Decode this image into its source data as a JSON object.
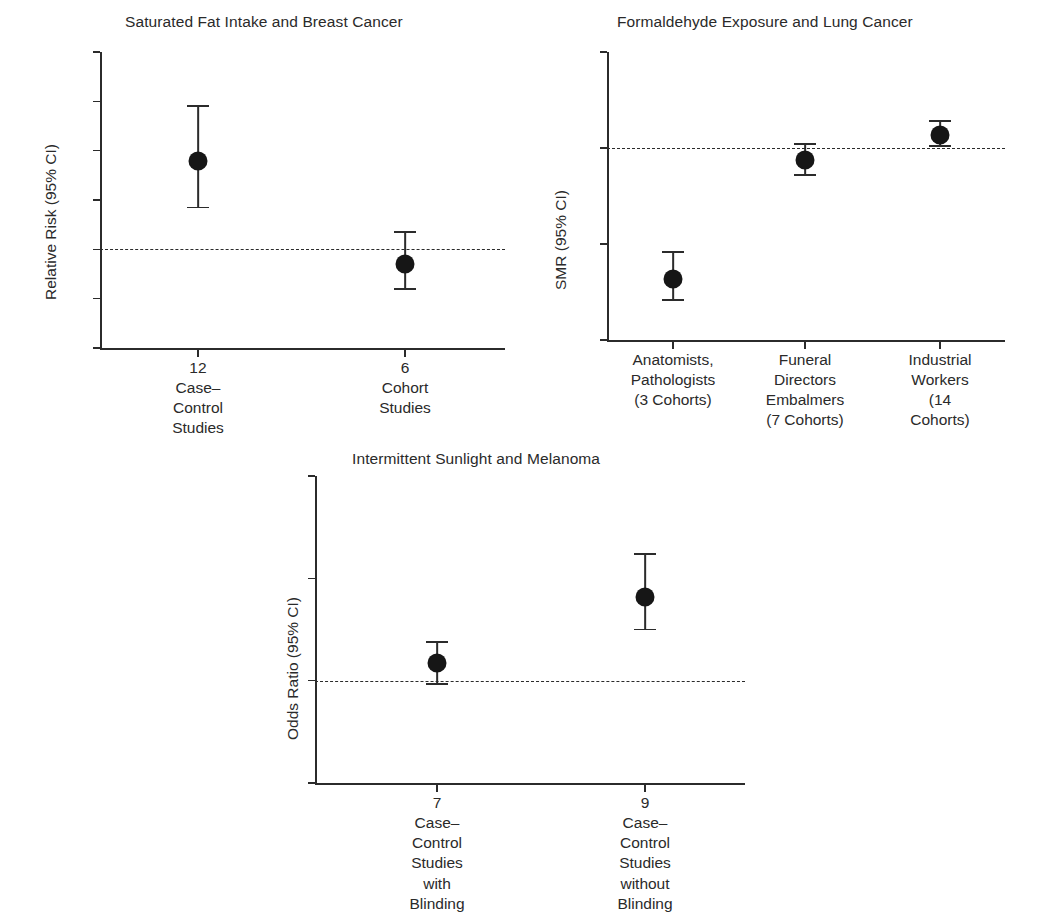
{
  "figure": {
    "panels": [
      "saturated_fat",
      "formaldehyde",
      "sunlight"
    ]
  },
  "chart_data": [
    {
      "type": "scatter",
      "id": "saturated_fat",
      "title": "Saturated Fat Intake and Breast Cancer",
      "ylabel": "Relative Risk (95% CI)",
      "xlabel": "",
      "ylim": [
        0.6,
        1.8
      ],
      "yticks": [
        0.6,
        0.8,
        1.0,
        1.2,
        1.4,
        1.6,
        1.8
      ],
      "ytick_labels": [
        "0.6",
        "0.8",
        "1.0",
        "1.2",
        "1.4",
        "1.6",
        "1.8"
      ],
      "grid": false,
      "legend": "none",
      "reference_line": 1.0,
      "reference_line_style": "dashed",
      "categories": [
        "12 Case–Control\nStudies",
        "6 Cohort Studies"
      ],
      "values": [
        1.36,
        0.94
      ],
      "ci_low": [
        1.17,
        0.84
      ],
      "ci_high": [
        1.58,
        1.07
      ]
    },
    {
      "type": "scatter",
      "id": "formaldehyde",
      "title": "Formaldehyde Exposure and Lung Cancer",
      "ylabel": "SMR (95% CI)",
      "xlabel": "",
      "ylim": [
        0,
        150
      ],
      "yticks": [
        0,
        50,
        100,
        150
      ],
      "ytick_labels": [
        "0",
        "50",
        "100",
        "150"
      ],
      "grid": false,
      "legend": "none",
      "reference_line": 100,
      "reference_line_style": "dashed",
      "categories": [
        "Anatomists,\nPathologists\n(3 Cohorts)",
        "Funeral Directors\nEmbalmers\n(7 Cohorts)",
        "Industrial\nWorkers\n(14 Cohorts)"
      ],
      "values": [
        32,
        94,
        107
      ],
      "ci_low": [
        21,
        86,
        101
      ],
      "ci_high": [
        46,
        102,
        114
      ]
    },
    {
      "type": "scatter",
      "id": "sunlight",
      "title": "Intermittent Sunlight and Melanoma",
      "ylabel": "Odds Ratio (95% CI)",
      "xlabel": "",
      "ylim": [
        0,
        3
      ],
      "yticks": [
        0,
        1,
        2,
        3
      ],
      "ytick_labels": [
        "0",
        "1",
        "2",
        "3"
      ],
      "grid": false,
      "legend": "none",
      "reference_line": 1.0,
      "reference_line_style": "dashed",
      "categories": [
        "7 Case–Control\nStudies with\nBlinding",
        "9 Case–Control\nStudies without\nBlinding"
      ],
      "values": [
        1.17,
        1.82
      ],
      "ci_low": [
        0.97,
        1.5
      ],
      "ci_high": [
        1.38,
        2.24
      ]
    }
  ],
  "style": {
    "marker_color": "#161616",
    "axis_color": "#2b2b2b",
    "text_color": "#2a2a2a",
    "background": "#ffffff"
  }
}
